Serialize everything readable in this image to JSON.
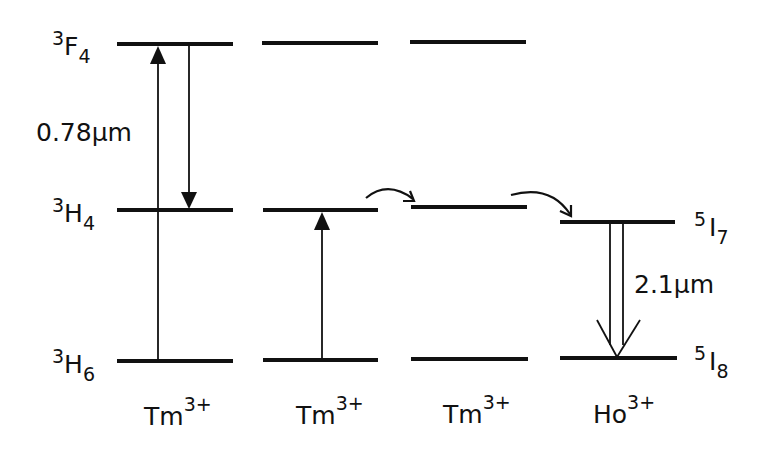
{
  "diagram": {
    "title": "",
    "colors": {
      "ink": "#111111",
      "background": "#ffffff"
    },
    "columns": [
      {
        "ion": {
          "base": "Tm",
          "charge": "3+"
        },
        "levels": [
          {
            "term": {
              "mult": "3",
              "letter": "F",
              "j": "4"
            }
          },
          {
            "term": {
              "mult": "3",
              "letter": "H",
              "j": "4"
            }
          },
          {
            "term": {
              "mult": "3",
              "letter": "H",
              "j": "6"
            }
          }
        ]
      },
      {
        "ion": {
          "base": "Tm",
          "charge": "3+"
        }
      },
      {
        "ion": {
          "base": "Tm",
          "charge": "3+"
        }
      },
      {
        "ion": {
          "base": "Ho",
          "charge": "3+"
        },
        "levels": [
          {
            "term": {
              "mult": "5",
              "letter": "I",
              "j": "7"
            }
          },
          {
            "term": {
              "mult": "5",
              "letter": "I",
              "j": "8"
            }
          }
        ]
      }
    ],
    "transitions": {
      "pump": {
        "value": "0.78",
        "unit": "μm",
        "from": "3H6",
        "to": "3F4"
      },
      "cross_relaxation": {
        "from": "3F4",
        "to": "3H4",
        "partner": "3H6 → 3H4"
      },
      "energy_migration": "3H4 → 3H4",
      "energy_transfer": "Tm 3H4 → Ho 5I7",
      "laser": {
        "value": "2.1",
        "unit": "μm",
        "from": "5I7",
        "to": "5I8"
      }
    }
  }
}
